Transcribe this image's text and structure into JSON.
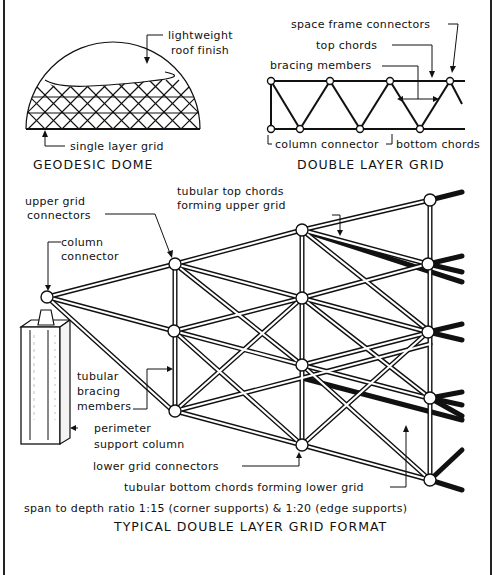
{
  "diagram": {
    "title": "TYPICAL DOUBLE LAYER GRID FORMAT",
    "ratio_note": "span to depth ratio 1:15 (corner supports) & 1:20 (edge supports)",
    "geodesic_dome": {
      "caption": "GEODESIC DOME",
      "labels": {
        "roof_finish_1": "lightweight",
        "roof_finish_2": "roof finish",
        "single_layer": "single layer grid"
      }
    },
    "double_layer_grid": {
      "caption": "DOUBLE LAYER GRID",
      "labels": {
        "space_frame_connectors": "space frame connectors",
        "top_chords": "top chords",
        "bracing_members": "bracing members",
        "column_connector": "column connector",
        "bottom_chords": "bottom chords"
      }
    },
    "perspective": {
      "labels": {
        "upper_grid_connectors_1": "upper grid",
        "upper_grid_connectors_2": "connectors",
        "tubular_top_chords_1": "tubular top chords",
        "tubular_top_chords_2": "forming upper grid",
        "column_connector_1": "column",
        "column_connector_2": "connector",
        "tubular_bracing_1": "tubular",
        "tubular_bracing_2": "bracing",
        "tubular_bracing_3": "members",
        "perimeter_column_1": "perimeter",
        "perimeter_column_2": "support column",
        "lower_grid_connectors": "lower grid connectors",
        "tubular_bottom_chords": "tubular bottom chords forming lower grid"
      }
    }
  }
}
